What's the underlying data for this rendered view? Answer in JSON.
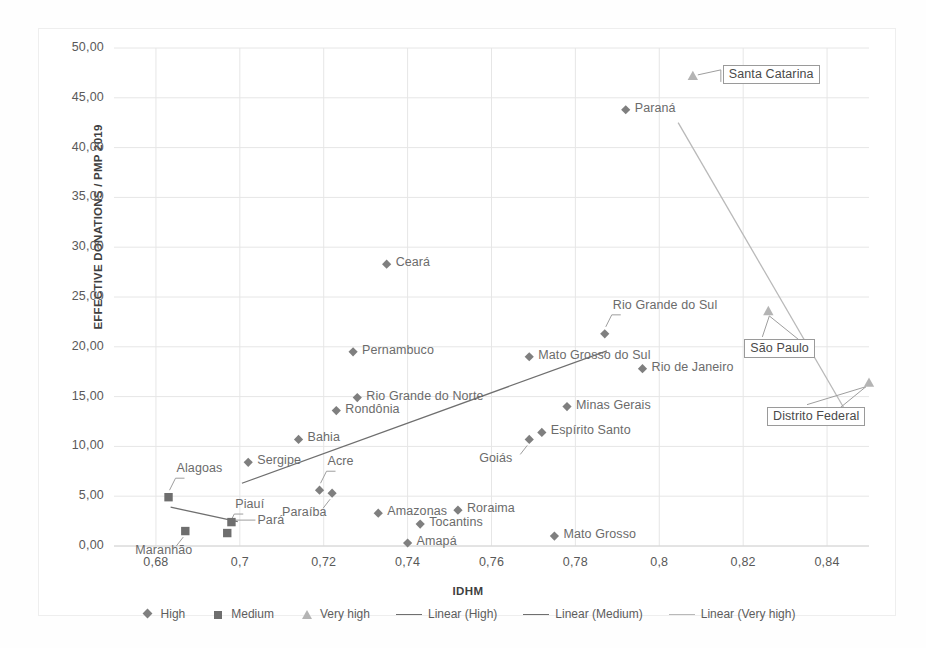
{
  "chart_data": {
    "type": "scatter",
    "title": "",
    "xlabel": "IDHM",
    "ylabel": "EFFECTIVE DONATIONS  / PMP 2019",
    "xlim": [
      0.67,
      0.85
    ],
    "ylim": [
      0,
      50
    ],
    "x_ticks": [
      "0,68",
      "0,7",
      "0,72",
      "0,74",
      "0,76",
      "0,78",
      "0,8",
      "0,82",
      "0,84"
    ],
    "x_tick_values": [
      0.68,
      0.7,
      0.72,
      0.74,
      0.76,
      0.78,
      0.8,
      0.82,
      0.84
    ],
    "y_ticks": [
      "0,00",
      "5,00",
      "10,00",
      "15,00",
      "20,00",
      "25,00",
      "30,00",
      "35,00",
      "40,00",
      "45,00",
      "50,00"
    ],
    "y_tick_values": [
      0,
      5,
      10,
      15,
      20,
      25,
      30,
      35,
      40,
      45,
      50
    ],
    "grid": true,
    "legend_position": "bottom",
    "series": [
      {
        "name": "High",
        "marker": "diamond",
        "color": "#7f7f7f",
        "points": [
          {
            "label": "Sergipe",
            "x": 0.702,
            "y": 8.4,
            "label_pos": "right"
          },
          {
            "label": "Bahia",
            "x": 0.714,
            "y": 10.7,
            "label_pos": "right"
          },
          {
            "label": "Acre",
            "x": 0.719,
            "y": 5.6,
            "label_pos": "callout-up"
          },
          {
            "label": "Paraíba",
            "x": 0.722,
            "y": 5.3,
            "label_pos": "callout-down"
          },
          {
            "label": "Rondônia",
            "x": 0.723,
            "y": 13.6,
            "label_pos": "right"
          },
          {
            "label": "Rio Grande do Norte",
            "x": 0.728,
            "y": 14.9,
            "label_pos": "right"
          },
          {
            "label": "Pernambuco",
            "x": 0.727,
            "y": 19.5,
            "label_pos": "right"
          },
          {
            "label": "Ceará",
            "x": 0.735,
            "y": 28.3,
            "label_pos": "right"
          },
          {
            "label": "Amazonas",
            "x": 0.733,
            "y": 3.3,
            "label_pos": "right"
          },
          {
            "label": "Amapá",
            "x": 0.74,
            "y": 0.3,
            "label_pos": "right"
          },
          {
            "label": "Tocantins",
            "x": 0.743,
            "y": 2.2,
            "label_pos": "right"
          },
          {
            "label": "Roraima",
            "x": 0.752,
            "y": 3.6,
            "label_pos": "right"
          },
          {
            "label": "Goiás",
            "x": 0.769,
            "y": 10.7,
            "label_pos": "callout-down"
          },
          {
            "label": "Espírito Santo",
            "x": 0.772,
            "y": 11.4,
            "label_pos": "right"
          },
          {
            "label": "Mato Grosso do Sul",
            "x": 0.769,
            "y": 19.0,
            "label_pos": "right"
          },
          {
            "label": "Mato Grosso",
            "x": 0.775,
            "y": 1.0,
            "label_pos": "right"
          },
          {
            "label": "Minas Gerais",
            "x": 0.778,
            "y": 14.0,
            "label_pos": "right"
          },
          {
            "label": "Rio Grande do Sul",
            "x": 0.787,
            "y": 21.3,
            "label_pos": "callout-up"
          },
          {
            "label": "Rio de Janeiro",
            "x": 0.796,
            "y": 17.8,
            "label_pos": "right"
          },
          {
            "label": "Paraná",
            "x": 0.792,
            "y": 43.8,
            "label_pos": "right"
          }
        ]
      },
      {
        "name": "Medium",
        "marker": "square",
        "color": "#6e6e6e",
        "points": [
          {
            "label": "Alagoas",
            "x": 0.683,
            "y": 4.9,
            "label_pos": "callout-up"
          },
          {
            "label": "Maranhão",
            "x": 0.687,
            "y": 1.5,
            "label_pos": "callout-down"
          },
          {
            "label": "Piauí",
            "x": 0.697,
            "y": 1.3,
            "label_pos": "callout-up"
          },
          {
            "label": "Pará",
            "x": 0.698,
            "y": 2.4,
            "label_pos": "callout-left"
          }
        ]
      },
      {
        "name": "Very high",
        "marker": "triangle",
        "color": "#b4b4b4",
        "points": [
          {
            "label": "Santa Catarina",
            "x": 0.808,
            "y": 47.2,
            "label_pos": "box-right"
          },
          {
            "label": "São Paulo",
            "x": 0.826,
            "y": 23.6,
            "label_pos": "box-below"
          },
          {
            "label": "Distrito Federal",
            "x": 0.85,
            "y": 16.4,
            "label_pos": "box-below-left"
          }
        ]
      }
    ],
    "trendlines": [
      {
        "name": "Linear (High)",
        "color": "#6f6f6f",
        "x0": 0.7005,
        "y0": 6.3,
        "x1": 0.7875,
        "y1": 19.6
      },
      {
        "name": "Linear (Medium)",
        "color": "#6f6f6f",
        "x0": 0.6835,
        "y0": 3.9,
        "x1": 0.6995,
        "y1": 2.45
      },
      {
        "name": "Linear (Very high)",
        "color": "#b9b9b9",
        "x0": 0.8045,
        "y0": 42.5,
        "x1": 0.8445,
        "y1": 13.5
      }
    ]
  },
  "legend": {
    "items": [
      {
        "label": "High",
        "marker": "diamond"
      },
      {
        "label": "Medium",
        "marker": "square"
      },
      {
        "label": "Very high",
        "marker": "triangle"
      },
      {
        "label": "Linear (High)",
        "marker": "line"
      },
      {
        "label": "Linear (Medium)",
        "marker": "line"
      },
      {
        "label": "Linear (Very high)",
        "marker": "line-light"
      }
    ]
  }
}
